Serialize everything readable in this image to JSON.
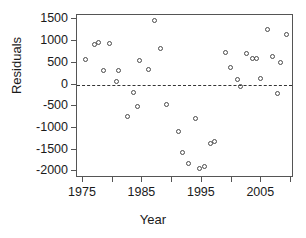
{
  "chart_data": {
    "type": "scatter",
    "title": "",
    "xlabel": "Year",
    "ylabel": "Residuals",
    "xlim": [
      1974,
      2010.5
    ],
    "ylim": [
      -2150,
      1600
    ],
    "grid": false,
    "legend": null,
    "reference_lines": [
      {
        "axis": "y",
        "value": 0,
        "style": "dashed"
      }
    ],
    "x_ticks": [
      {
        "value": 1975,
        "label": "1975"
      },
      {
        "value": 1980,
        "label": ""
      },
      {
        "value": 1985,
        "label": "1985"
      },
      {
        "value": 1990,
        "label": ""
      },
      {
        "value": 1995,
        "label": "1995"
      },
      {
        "value": 2000,
        "label": ""
      },
      {
        "value": 2005,
        "label": "2005"
      },
      {
        "value": 2010,
        "label": ""
      }
    ],
    "y_ticks": [
      {
        "value": 1500,
        "label": "1500"
      },
      {
        "value": 1000,
        "label": "1000"
      },
      {
        "value": 500,
        "label": "500"
      },
      {
        "value": 0,
        "label": "0"
      },
      {
        "value": -500,
        "label": "-500"
      },
      {
        "value": -1000,
        "label": "-1000"
      },
      {
        "value": -1500,
        "label": "-1500"
      },
      {
        "value": -2000,
        "label": "-2000"
      }
    ],
    "marker": "open-circle",
    "points": [
      {
        "x": 1975.5,
        "y": 575
      },
      {
        "x": 1977.0,
        "y": 930
      },
      {
        "x": 1977.7,
        "y": 960
      },
      {
        "x": 1979.5,
        "y": 940
      },
      {
        "x": 1978.5,
        "y": 315
      },
      {
        "x": 1981.0,
        "y": 330
      },
      {
        "x": 1980.7,
        "y": 60
      },
      {
        "x": 1982.5,
        "y": -730
      },
      {
        "x": 1983.5,
        "y": -180
      },
      {
        "x": 1984.5,
        "y": 560
      },
      {
        "x": 1984.2,
        "y": -500
      },
      {
        "x": 1986.0,
        "y": 350
      },
      {
        "x": 1987.0,
        "y": 1480
      },
      {
        "x": 1988.0,
        "y": 820
      },
      {
        "x": 1989.0,
        "y": -450
      },
      {
        "x": 1991.0,
        "y": -1090
      },
      {
        "x": 1991.8,
        "y": -1560
      },
      {
        "x": 1992.8,
        "y": -1810
      },
      {
        "x": 1994.0,
        "y": -780
      },
      {
        "x": 1994.6,
        "y": -1930
      },
      {
        "x": 1995.5,
        "y": -1880
      },
      {
        "x": 1996.5,
        "y": -1350
      },
      {
        "x": 1997.2,
        "y": -1300
      },
      {
        "x": 1999.0,
        "y": 745
      },
      {
        "x": 1999.8,
        "y": 395
      },
      {
        "x": 2001.0,
        "y": 110
      },
      {
        "x": 2001.5,
        "y": -55
      },
      {
        "x": 2002.5,
        "y": 715
      },
      {
        "x": 2003.5,
        "y": 590
      },
      {
        "x": 2004.2,
        "y": 600
      },
      {
        "x": 2004.8,
        "y": 135
      },
      {
        "x": 2006.0,
        "y": 1275
      },
      {
        "x": 2006.8,
        "y": 635
      },
      {
        "x": 2007.8,
        "y": -215
      },
      {
        "x": 2008.2,
        "y": 515
      },
      {
        "x": 2009.3,
        "y": 1155
      }
    ]
  }
}
